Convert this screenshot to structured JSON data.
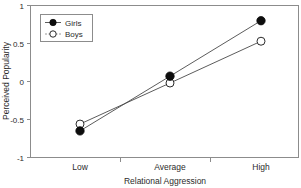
{
  "chart_data": {
    "type": "line",
    "title": "",
    "xlabel": "Relational Aggression",
    "ylabel": "Perceived Popularity",
    "categories": [
      "Low",
      "Average",
      "High"
    ],
    "ylim": [
      -1,
      1
    ],
    "yticks": [
      "-1",
      "-0.5",
      "0",
      "0.5",
      "1"
    ],
    "ytick_values": [
      -1,
      -0.5,
      0,
      0.5,
      1
    ],
    "grid": false,
    "legend_position": "upper-left-inside",
    "series": [
      {
        "name": "Girls",
        "marker": "filled-circle",
        "values": [
          -0.65,
          0.07,
          0.8
        ]
      },
      {
        "name": "Boys",
        "marker": "open-circle",
        "values": [
          -0.56,
          -0.02,
          0.53
        ]
      }
    ]
  },
  "figure": {
    "background_color": "#ffffff",
    "frame_color": "#8c8c8c",
    "line_color": "#4a4a4a",
    "girls_marker_color": "#0d0d0d",
    "boys_marker_color": "#ffffff",
    "text_color": "#2b2b2b"
  },
  "axes": {
    "y_tick_1": "1",
    "y_tick_2": "0.5",
    "y_tick_3": "0",
    "y_tick_4": "-0.5",
    "y_tick_5": "-1",
    "x_cat_1": "Low",
    "x_cat_2": "Average",
    "x_cat_3": "High",
    "x_title": "Relational Aggression",
    "y_title": "Perceived Popularity"
  },
  "legend": {
    "entry_1": "Girls",
    "entry_2": "Boys"
  }
}
